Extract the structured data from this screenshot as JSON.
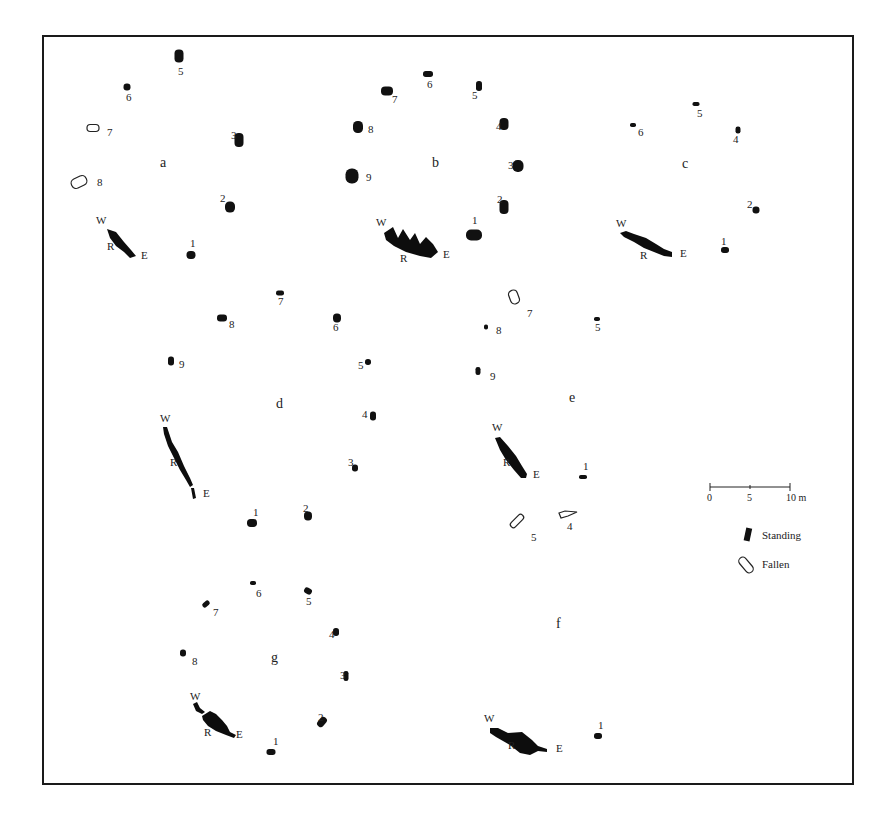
{
  "figure": {
    "type": "archaeological-site-plan"
  },
  "circles": [
    {
      "id": "a",
      "label": "a",
      "label_pos": [
        160,
        167
      ],
      "recumbent": {
        "W": [
          96,
          224
        ],
        "R": [
          107,
          250
        ],
        "E": [
          141,
          259
        ],
        "shape": "M107,229 L116,232 L124,242 L131,250 L136,256 L130,258 L124,252 L116,246 L110,238 Z"
      },
      "stones": [
        {
          "n": "1",
          "status": "standing",
          "x": 191,
          "y": 255,
          "w": 9,
          "h": 8,
          "num_pos": [
            190,
            247
          ]
        },
        {
          "n": "2",
          "status": "standing",
          "x": 230,
          "y": 207,
          "w": 10,
          "h": 11,
          "num_pos": [
            220,
            202
          ]
        },
        {
          "n": "3",
          "status": "standing",
          "x": 239,
          "y": 140,
          "w": 9,
          "h": 14,
          "num_pos": [
            231,
            139
          ]
        },
        {
          "n": "5",
          "status": "standing",
          "x": 179,
          "y": 56,
          "w": 9,
          "h": 13,
          "num_pos": [
            178,
            75
          ]
        },
        {
          "n": "6",
          "status": "standing",
          "x": 127,
          "y": 87,
          "w": 7,
          "h": 7,
          "num_pos": [
            126,
            101
          ]
        },
        {
          "n": "7",
          "status": "fallen",
          "x": 93,
          "y": 128,
          "w": 12,
          "h": 7,
          "num_pos": [
            107,
            136
          ]
        },
        {
          "n": "8",
          "status": "fallen",
          "x": 79,
          "y": 182,
          "w": 16,
          "h": 10,
          "num_pos": [
            97,
            186
          ],
          "rot": -25
        }
      ]
    },
    {
      "id": "b",
      "label": "b",
      "label_pos": [
        432,
        167
      ],
      "recumbent": {
        "W": [
          376,
          226
        ],
        "R": [
          400,
          262
        ],
        "E": [
          443,
          258
        ],
        "shape": "M384,233 L393,227 L398,238 L403,229 L410,240 L415,233 L420,244 L426,237 L433,244 L438,252 L431,258 L420,256 L406,252 L394,246 L386,240 Z"
      },
      "stones": [
        {
          "n": "1",
          "status": "standing",
          "x": 474,
          "y": 235,
          "w": 16,
          "h": 11,
          "num_pos": [
            472,
            224
          ]
        },
        {
          "n": "2",
          "status": "standing",
          "x": 504,
          "y": 207,
          "w": 9,
          "h": 14,
          "num_pos": [
            497,
            203
          ]
        },
        {
          "n": "3",
          "status": "standing",
          "x": 518,
          "y": 166,
          "w": 11,
          "h": 12,
          "num_pos": [
            508,
            169
          ]
        },
        {
          "n": "4",
          "status": "standing",
          "x": 504,
          "y": 124,
          "w": 9,
          "h": 12,
          "num_pos": [
            496,
            130
          ]
        },
        {
          "n": "5",
          "status": "standing",
          "x": 479,
          "y": 86,
          "w": 6,
          "h": 10,
          "num_pos": [
            472,
            99
          ]
        },
        {
          "n": "6",
          "status": "standing",
          "x": 428,
          "y": 74,
          "w": 10,
          "h": 6,
          "num_pos": [
            427,
            88
          ]
        },
        {
          "n": "7",
          "status": "standing",
          "x": 387,
          "y": 91,
          "w": 12,
          "h": 9,
          "num_pos": [
            392,
            103
          ]
        },
        {
          "n": "8",
          "status": "standing",
          "x": 358,
          "y": 127,
          "w": 10,
          "h": 12,
          "num_pos": [
            368,
            133
          ]
        },
        {
          "n": "9",
          "status": "standing",
          "x": 352,
          "y": 176,
          "w": 13,
          "h": 15,
          "num_pos": [
            366,
            181
          ]
        }
      ]
    },
    {
      "id": "c",
      "label": "c",
      "label_pos": [
        682,
        168
      ],
      "recumbent": {
        "W": [
          616,
          227
        ],
        "R": [
          640,
          259
        ],
        "E": [
          680,
          257
        ],
        "shape": "M620,233 L626,231 L634,234 L646,238 L656,244 L664,249 L672,252 L672,257 L664,256 L654,252 L644,248 L634,242 L624,237 Z"
      },
      "stones": [
        {
          "n": "1",
          "status": "standing",
          "x": 725,
          "y": 250,
          "w": 8,
          "h": 6,
          "num_pos": [
            721,
            245
          ]
        },
        {
          "n": "2",
          "status": "standing",
          "x": 756,
          "y": 210,
          "w": 7,
          "h": 7,
          "num_pos": [
            747,
            208
          ]
        },
        {
          "n": "4",
          "status": "standing",
          "x": 738,
          "y": 130,
          "w": 5,
          "h": 7,
          "num_pos": [
            733,
            143
          ]
        },
        {
          "n": "5",
          "status": "standing",
          "x": 696,
          "y": 104,
          "w": 7,
          "h": 4,
          "num_pos": [
            697,
            117
          ]
        },
        {
          "n": "6",
          "status": "standing",
          "x": 633,
          "y": 125,
          "w": 6,
          "h": 4,
          "num_pos": [
            638,
            136
          ]
        }
      ]
    },
    {
      "id": "d",
      "label": "d",
      "label_pos": [
        276,
        408
      ],
      "recumbent": {
        "W": [
          160,
          422
        ],
        "R": [
          170,
          466
        ],
        "E": [
          203,
          497
        ],
        "shape": "M163,427 L167,427 L172,442 L178,452 L184,466 L190,478 L193,485 L190,487 L186,480 L180,470 L174,458 L168,446 L164,434 Z M191,488 L194,488 L196,498 L193,499 Z"
      },
      "stones": [
        {
          "n": "1",
          "status": "standing",
          "x": 252,
          "y": 523,
          "w": 10,
          "h": 8,
          "num_pos": [
            253,
            516
          ]
        },
        {
          "n": "2",
          "status": "standing",
          "x": 308,
          "y": 516,
          "w": 8,
          "h": 9,
          "num_pos": [
            303,
            512
          ]
        },
        {
          "n": "3",
          "status": "standing",
          "x": 355,
          "y": 468,
          "w": 6,
          "h": 7,
          "num_pos": [
            348,
            466
          ]
        },
        {
          "n": "4",
          "status": "standing",
          "x": 373,
          "y": 416,
          "w": 6,
          "h": 9,
          "num_pos": [
            362,
            418
          ]
        },
        {
          "n": "5",
          "status": "standing",
          "x": 368,
          "y": 362,
          "w": 6,
          "h": 6,
          "num_pos": [
            358,
            369
          ]
        },
        {
          "n": "6",
          "status": "standing",
          "x": 337,
          "y": 318,
          "w": 8,
          "h": 9,
          "num_pos": [
            333,
            331
          ]
        },
        {
          "n": "7",
          "status": "standing",
          "x": 280,
          "y": 293,
          "w": 8,
          "h": 5,
          "num_pos": [
            278,
            305
          ]
        },
        {
          "n": "8",
          "status": "standing",
          "x": 222,
          "y": 318,
          "w": 10,
          "h": 7,
          "num_pos": [
            229,
            328
          ]
        },
        {
          "n": "9",
          "status": "standing",
          "x": 171,
          "y": 361,
          "w": 6,
          "h": 9,
          "num_pos": [
            179,
            368
          ]
        }
      ]
    },
    {
      "id": "e",
      "label": "e",
      "label_pos": [
        569,
        402
      ],
      "recumbent": {
        "W": [
          492,
          431
        ],
        "R": [
          503,
          466
        ],
        "E": [
          533,
          478
        ],
        "shape": "M495,438 L500,437 L508,446 L516,456 L522,466 L527,474 L526,478 L521,478 L514,470 L506,460 L500,450 Z"
      },
      "stones": [
        {
          "n": "1",
          "status": "standing",
          "x": 583,
          "y": 477,
          "w": 8,
          "h": 4,
          "num_pos": [
            583,
            470
          ]
        },
        {
          "n": "4",
          "status": "fallen",
          "x": 560,
          "y": 510,
          "w": 16,
          "h": 8,
          "num_pos": [
            567,
            530
          ],
          "shape": "M559,513 L565,511 L577,512 L568,516 L561,518 Z"
        },
        {
          "n": "5",
          "status": "fallen",
          "x": 517,
          "y": 521,
          "w": 6,
          "h": 16,
          "num_pos": [
            531,
            541
          ],
          "rot": 45
        },
        {
          "n": "5",
          "status": "standing",
          "x": 597,
          "y": 319,
          "w": 6,
          "h": 4,
          "num_pos": [
            595,
            331
          ]
        },
        {
          "n": "7",
          "status": "fallen",
          "x": 514,
          "y": 297,
          "w": 9,
          "h": 14,
          "num_pos": [
            527,
            317
          ],
          "rot": -20
        },
        {
          "n": "8",
          "status": "standing",
          "x": 486,
          "y": 327,
          "w": 4,
          "h": 5,
          "num_pos": [
            496,
            334
          ]
        },
        {
          "n": "9",
          "status": "standing",
          "x": 478,
          "y": 371,
          "w": 5,
          "h": 8,
          "num_pos": [
            490,
            380
          ]
        }
      ]
    },
    {
      "id": "f",
      "label": "f",
      "label_pos": [
        556,
        628
      ],
      "recumbent": {
        "W": [
          484,
          722
        ],
        "R": [
          508,
          749
        ],
        "E": [
          556,
          752
        ],
        "shape": "M490,728 L498,728 L508,733 L522,732 L532,740 L538,746 L547,749 L547,752 L538,751 L530,755 L520,753 L510,745 L496,737 L490,733 Z"
      },
      "stones": [
        {
          "n": "1",
          "status": "standing",
          "x": 598,
          "y": 736,
          "w": 8,
          "h": 6,
          "num_pos": [
            598,
            729
          ]
        }
      ]
    },
    {
      "id": "g",
      "label": "g",
      "label_pos": [
        271,
        662
      ],
      "recumbent": {
        "W": [
          190,
          700
        ],
        "R": [
          204,
          736
        ],
        "E": [
          236,
          738
        ],
        "shape": "M193,704 L197,702 L200,708 L205,712 L202,714 L196,711 Z M202,716 L210,711 L216,714 L222,720 L227,726 L230,732 L236,735 L234,738 L226,735 L216,731 L208,726 L203,720 Z"
      },
      "stones": [
        {
          "n": "1",
          "status": "standing",
          "x": 271,
          "y": 752,
          "w": 9,
          "h": 6,
          "num_pos": [
            273,
            745
          ]
        },
        {
          "n": "2",
          "status": "standing",
          "x": 322,
          "y": 722,
          "w": 7,
          "h": 11,
          "num_pos": [
            318,
            721
          ],
          "rot": 40
        },
        {
          "n": "3",
          "status": "standing",
          "x": 346,
          "y": 676,
          "w": 5,
          "h": 10,
          "num_pos": [
            340,
            679
          ]
        },
        {
          "n": "4",
          "status": "standing",
          "x": 336,
          "y": 632,
          "w": 6,
          "h": 8,
          "num_pos": [
            329,
            638
          ]
        },
        {
          "n": "5",
          "status": "standing",
          "x": 308,
          "y": 591,
          "w": 8,
          "h": 6,
          "num_pos": [
            306,
            605
          ],
          "rot": 30
        },
        {
          "n": "6",
          "status": "standing",
          "x": 253,
          "y": 583,
          "w": 6,
          "h": 4,
          "num_pos": [
            256,
            597
          ]
        },
        {
          "n": "7",
          "status": "standing",
          "x": 206,
          "y": 604,
          "w": 8,
          "h": 5,
          "num_pos": [
            213,
            616
          ],
          "rot": -40
        },
        {
          "n": "8",
          "status": "standing",
          "x": 183,
          "y": 653,
          "w": 6,
          "h": 7,
          "num_pos": [
            192,
            665
          ]
        }
      ]
    }
  ],
  "compass_labels": {
    "west": "W",
    "recumbent": "R",
    "east": "E"
  },
  "scale_bar": {
    "ticks": [
      "0",
      "5",
      "10 m"
    ],
    "x0": 710,
    "x1": 790,
    "y": 487
  },
  "legend": {
    "items": [
      {
        "label": "Standing",
        "type": "standing"
      },
      {
        "label": "Fallen",
        "type": "fallen"
      }
    ]
  },
  "frame": {
    "x": 43,
    "y": 36,
    "w": 810,
    "h": 748
  },
  "colors": {
    "ink": "#111111",
    "paper": "#ffffff"
  }
}
